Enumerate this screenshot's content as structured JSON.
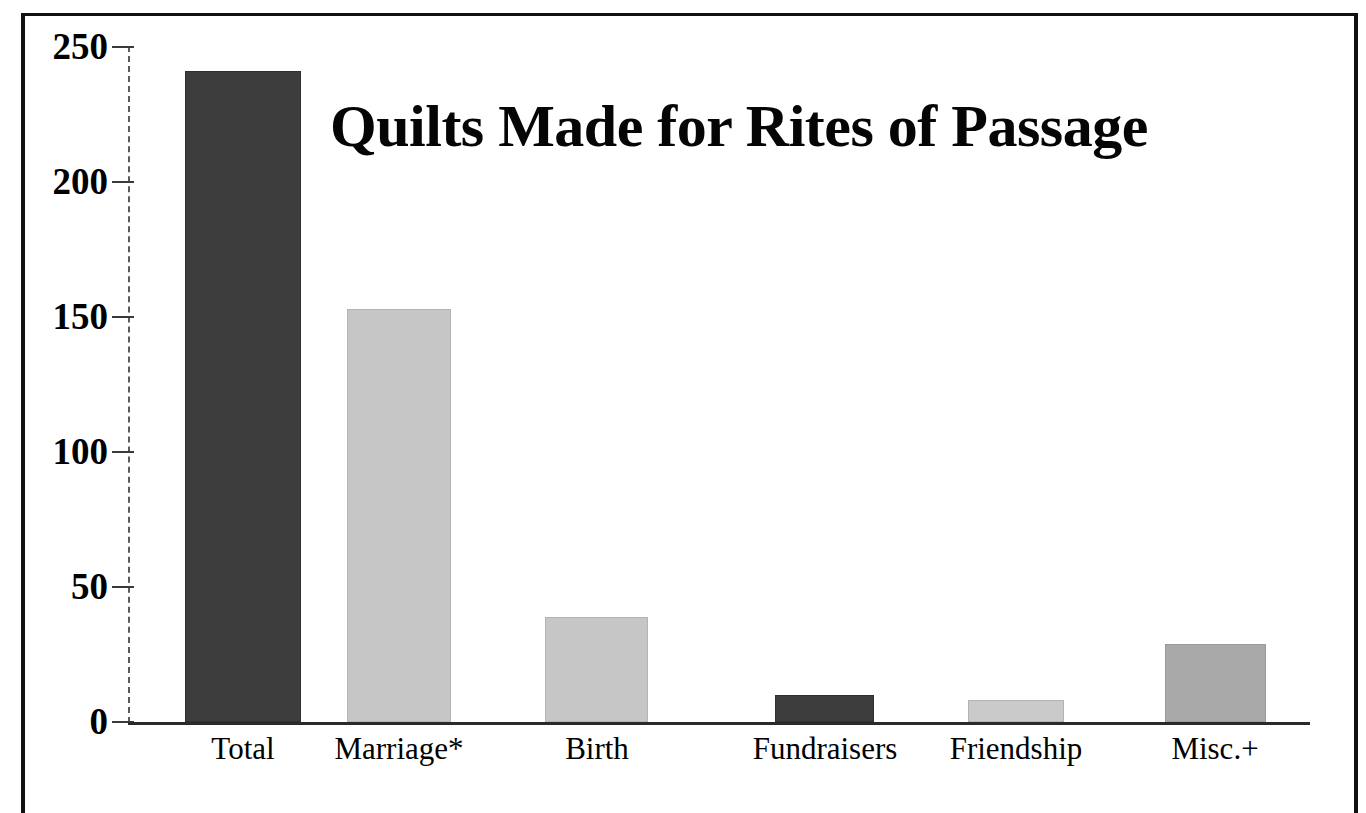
{
  "chart_data": {
    "type": "bar",
    "title": "Quilts Made for Rites of Passage",
    "xlabel": "",
    "ylabel": "",
    "categories": [
      "Total",
      "Marriage*",
      "Birth",
      "Fundraisers",
      "Friendship",
      "Misc.+"
    ],
    "values": [
      241,
      153,
      39,
      10,
      8,
      29
    ],
    "ylim": [
      0,
      250
    ],
    "yticks": [
      "0",
      "50",
      "100",
      "150",
      "200",
      "250"
    ],
    "ytick_values": [
      0,
      50,
      100,
      150,
      200,
      250
    ],
    "grid": false,
    "legend": "none",
    "bar_colors": [
      "#3d3d3d",
      "#c6c6c6",
      "#c6c6c6",
      "#3d3d3d",
      "#cacaca",
      "#a9a9a9"
    ]
  },
  "figure": {
    "frame_color": "#111111",
    "background": "#ffffff",
    "axis_color": "#2a2a2a",
    "footnote": ""
  }
}
